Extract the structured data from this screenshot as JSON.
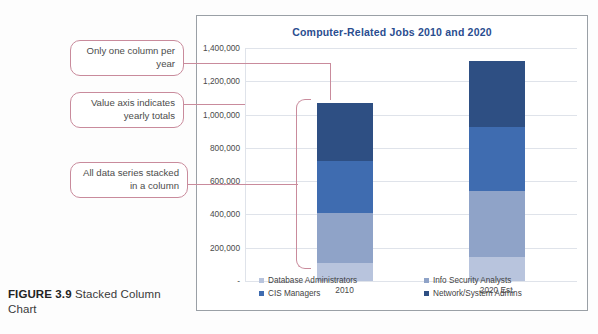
{
  "caption": {
    "figure_label": "FIGURE 3.9",
    "figure_text": "Stacked Column Chart"
  },
  "callouts": [
    {
      "id": "one-column-per-year",
      "text": "Only one column per year"
    },
    {
      "id": "value-axis-totals",
      "text": "Value axis indicates yearly totals"
    },
    {
      "id": "stacked-series",
      "text": "All data series stacked in a column"
    }
  ],
  "chart_data": {
    "type": "bar",
    "subtype": "stacked-column",
    "title": "Computer-Related Jobs 2010 and 2020",
    "xlabel": "",
    "ylabel": "",
    "categories": [
      "2010",
      "2020 Est."
    ],
    "ylim": [
      0,
      1400000
    ],
    "yticks": [
      0,
      200000,
      400000,
      600000,
      800000,
      1000000,
      1200000,
      1400000
    ],
    "ytick_labels": [
      "-",
      "200,000",
      "400,000",
      "600,000",
      "800,000",
      "1,000,000",
      "1,200,000",
      "1,400,000"
    ],
    "grid": true,
    "legend_position": "bottom",
    "series": [
      {
        "name": "Database Administrators",
        "color": "#b8c4dd",
        "values": [
          110000,
          144000
        ]
      },
      {
        "name": "Info Security Analysts",
        "color": "#8fa3c8",
        "values": [
          300000,
          395000
        ]
      },
      {
        "name": "CIS Managers",
        "color": "#3f6cb0",
        "values": [
          310000,
          385000
        ]
      },
      {
        "name": "Network/System Admins",
        "color": "#2e4f83",
        "values": [
          350000,
          396000
        ]
      }
    ],
    "totals": [
      1070000,
      1320000
    ]
  }
}
